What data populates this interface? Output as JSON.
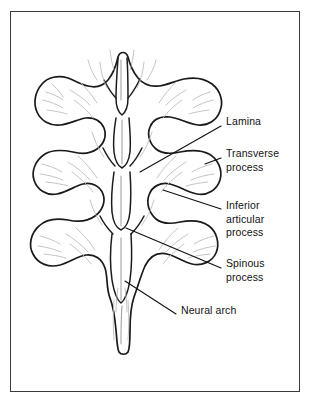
{
  "figure": {
    "kind": "anatomical-illustration",
    "background_color": "#ffffff",
    "frame_color": "#3a3a3a",
    "outline_color": "#1a1a1a",
    "texture_color": "#b9b9b9",
    "label_color": "#121212"
  },
  "labels": [
    {
      "id": "lamina",
      "text": "Lamina",
      "x": 226,
      "y": 121,
      "leader": {
        "x1": 221,
        "y1": 126,
        "x2": 140,
        "y2": 172
      }
    },
    {
      "id": "transverse-process",
      "text": "Transverse\nprocess",
      "x": 226,
      "y": 153,
      "leader": {
        "x1": 221,
        "y1": 158,
        "x2": 205,
        "y2": 164
      }
    },
    {
      "id": "inferior-articular-process",
      "text": "Inferior\narticular\nprocess",
      "x": 226,
      "y": 205,
      "leader": {
        "x1": 221,
        "y1": 209,
        "x2": 163,
        "y2": 190
      }
    },
    {
      "id": "spinous-process",
      "text": "Spinous\nprocess",
      "x": 226,
      "y": 263,
      "leader": {
        "x1": 221,
        "y1": 268,
        "x2": 126,
        "y2": 228
      }
    },
    {
      "id": "neural-arch",
      "text": "Neural arch",
      "x": 181,
      "y": 310,
      "leader": {
        "x1": 176,
        "y1": 314,
        "x2": 125,
        "y2": 281
      }
    }
  ]
}
